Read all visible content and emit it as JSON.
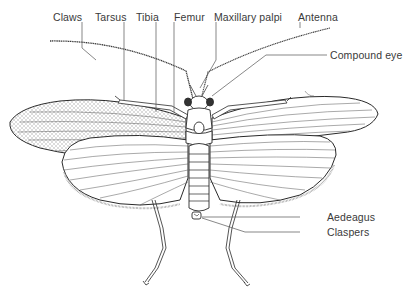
{
  "diagram": {
    "labels": {
      "claws": "Claws",
      "tarsus": "Tarsus",
      "tibia": "Tibia",
      "femur": "Femur",
      "maxillary_palpi": "Maxillary palpi",
      "antenna": "Antenna",
      "compound_eye": "Compound eye",
      "aedeagus": "Aedeagus",
      "claspers": "Claspers"
    },
    "colors": {
      "line": "#2a2a2a",
      "leader": "#555555",
      "text": "#3a3a3a",
      "background": "#ffffff"
    }
  }
}
